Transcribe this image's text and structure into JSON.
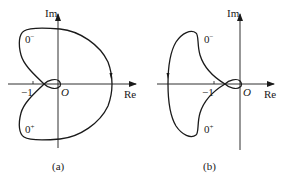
{
  "panels": [
    {
      "id": "a",
      "caption": "(a)",
      "axis_x_label": "Re",
      "axis_y_label": "Im",
      "origin_label": "O",
      "tick_label": "−1",
      "upper_label_base": "0",
      "upper_label_sup": "−",
      "lower_label_base": "0",
      "lower_label_sup": "+",
      "description": "Nyquist plot: large lobe crossing positive real axis, small loop near origin, self-intersection left of origin between −1 and 0"
    },
    {
      "id": "b",
      "caption": "(b)",
      "axis_x_label": "Re",
      "axis_y_label": "Im",
      "origin_label": "O",
      "tick_label": "−1",
      "upper_label_base": "0",
      "upper_label_sup": "−",
      "lower_label_base": "0",
      "lower_label_sup": "+",
      "description": "Nyquist plot: lobe crossing negative real axis left of −1, small loop near origin, self-intersection right of −1"
    }
  ],
  "colors": {
    "stroke": "#1a1a1a",
    "background": "#ffffff"
  }
}
